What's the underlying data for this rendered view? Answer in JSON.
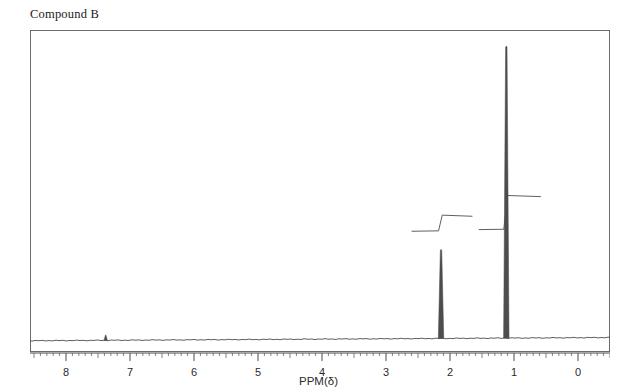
{
  "title": "Compound B",
  "axis": {
    "label": "PPM(δ)",
    "tick_labels": [
      "8",
      "7",
      "6",
      "5",
      "4",
      "3",
      "2",
      "1",
      "0"
    ]
  },
  "colors": {
    "trace": "#4d4d4d",
    "frame": "#6b6b6b",
    "text": "#1a1a1a",
    "background": "#ffffff"
  },
  "chart_data": {
    "type": "line",
    "title": "Compound B",
    "xlabel": "PPM(δ)",
    "ylabel": "",
    "xlim": [
      8.6,
      -0.5
    ],
    "x_axis_inverted": true,
    "grid": false,
    "legend": null,
    "x_ticks": [
      8,
      7,
      6,
      5,
      4,
      3,
      2,
      1,
      0
    ],
    "minor_tick_interval": 0.1,
    "peaks": [
      {
        "name": "residual-solvent",
        "ppm": 7.38,
        "relative_height": 0.02,
        "multiplicity": "s",
        "integral": null
      },
      {
        "name": "peak-a",
        "ppm": 2.14,
        "relative_height": 0.31,
        "multiplicity": "s",
        "integral": 3
      },
      {
        "name": "peak-b",
        "ppm": 1.12,
        "relative_height": 1.0,
        "multiplicity": "s",
        "integral": 9
      }
    ],
    "integrals": [
      {
        "name": "integral-a",
        "start_ppm": 2.6,
        "end_ppm": 1.65,
        "rise_ppm": 2.14,
        "step_height": 0.05,
        "baseline_y": 0.375
      },
      {
        "name": "integral-b",
        "start_ppm": 1.55,
        "end_ppm": 0.58,
        "rise_ppm": 1.12,
        "step_height": 0.106,
        "baseline_y": 0.38
      }
    ],
    "baseline": {
      "left_y": 0.035,
      "right_y": 0.045,
      "description": "slight upward drift toward low ppm"
    }
  }
}
